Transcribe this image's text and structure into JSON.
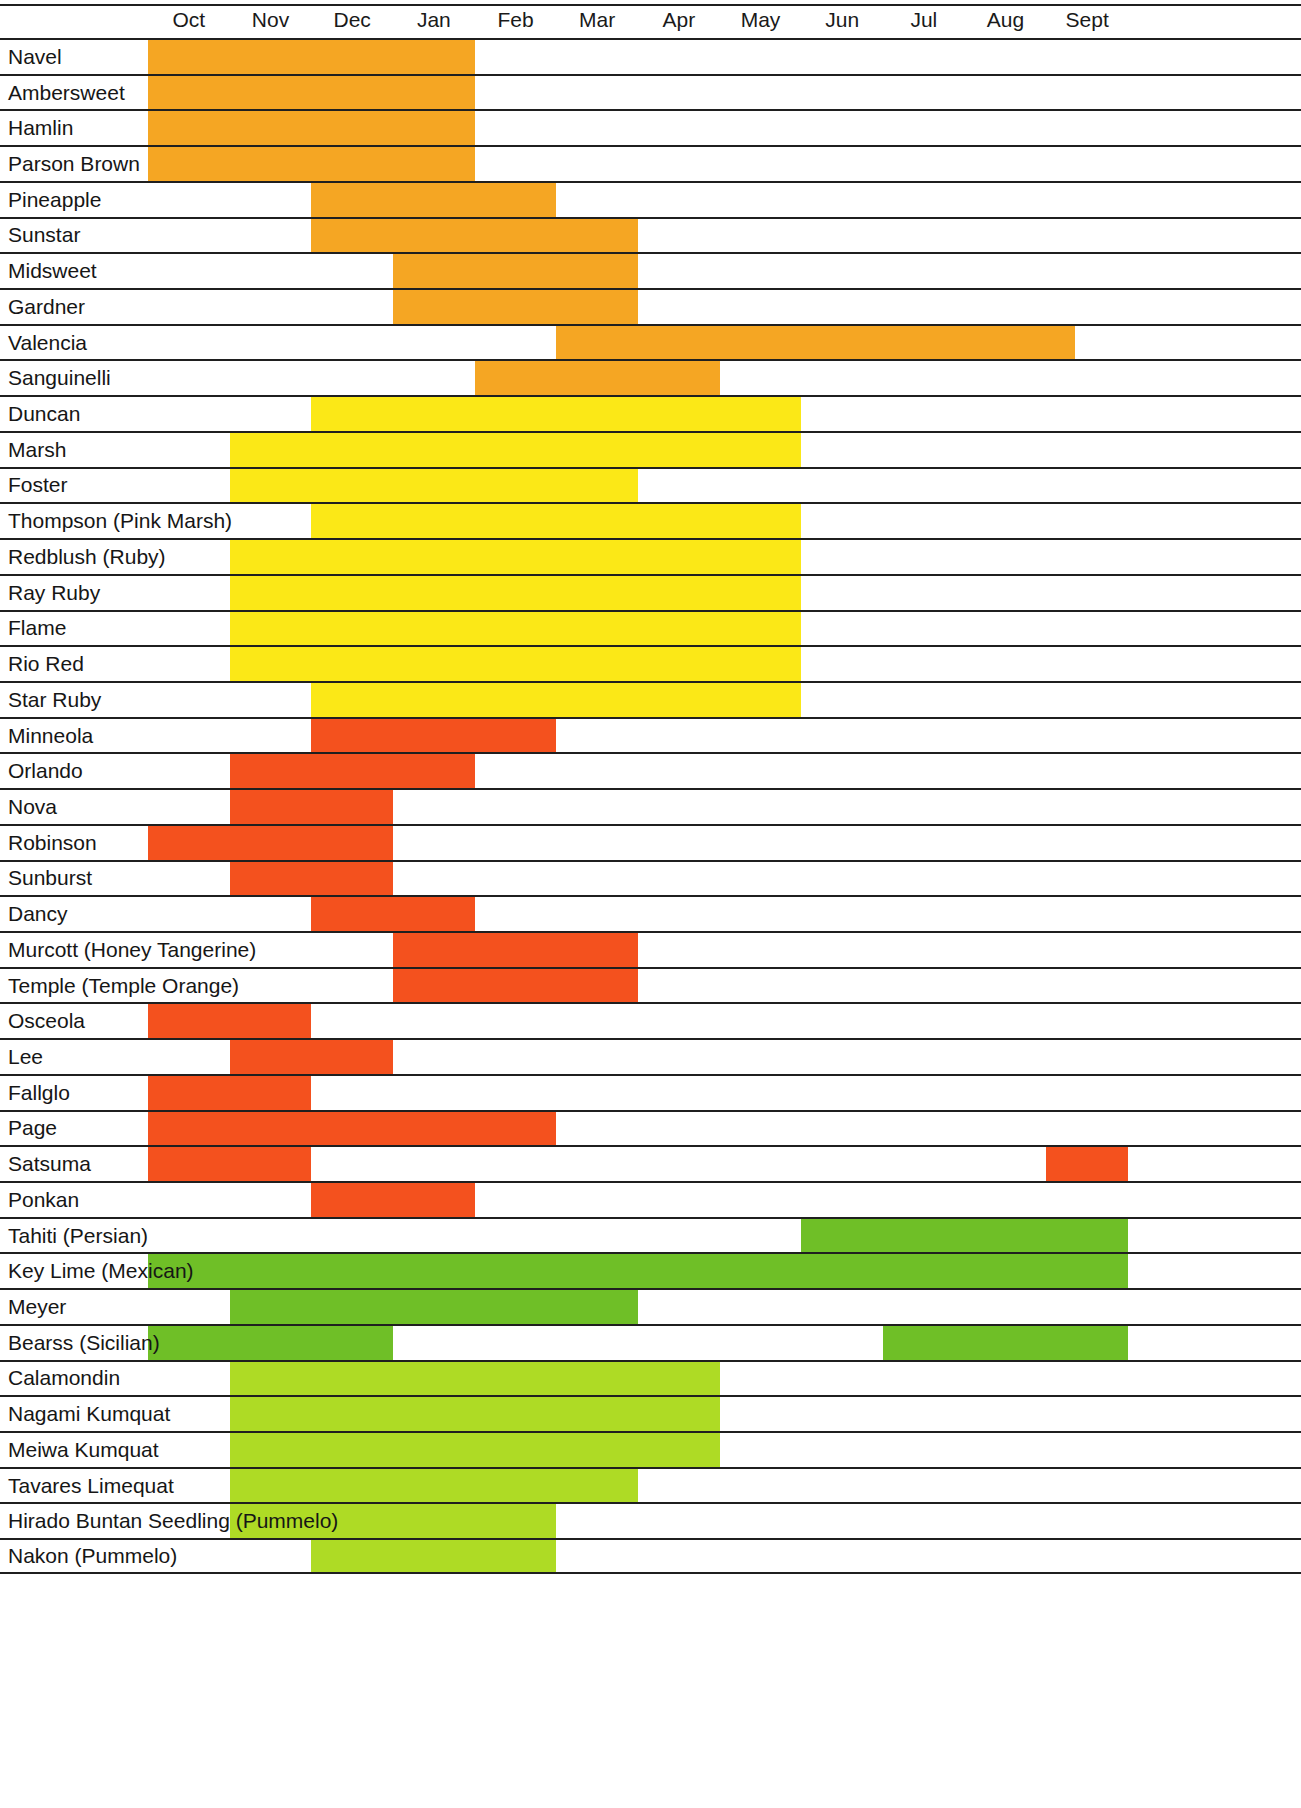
{
  "header": {
    "months": [
      "Oct",
      "Nov",
      "Dec",
      "Jan",
      "Feb",
      "Mar",
      "Apr",
      "May",
      "Jun",
      "Jul",
      "Aug",
      "Sept"
    ]
  },
  "colors": {
    "orange": "#F5A623",
    "yellow": "#FBE817",
    "red_orange": "#F4511E",
    "green": "#6FBF27",
    "yellow_green": "#AEDB25",
    "rule": "#1F1F1F",
    "text": "#161616",
    "background": "#FFFFFF"
  },
  "chart_data": {
    "type": "table",
    "xlabel": "",
    "ylabel": "",
    "grid": true,
    "legend_position": "none",
    "categories": [
      "Oct",
      "Nov",
      "Dec",
      "Jan",
      "Feb",
      "Mar",
      "Apr",
      "May",
      "Jun",
      "Jul",
      "Aug",
      "Sept"
    ],
    "x_axis_note": "Season runs October through September; 12 equal month columns",
    "groups": [
      {
        "name": "Oranges",
        "color": "#F5A623",
        "rows": [
          {
            "label": "Navel",
            "spans": [
              {
                "start_month": "Oct",
                "end_month": "Jan",
                "start_index": 0,
                "end_index": 4
              }
            ]
          },
          {
            "label": "Ambersweet",
            "spans": [
              {
                "start_month": "Oct",
                "end_month": "Jan",
                "start_index": 0,
                "end_index": 4
              }
            ]
          },
          {
            "label": "Hamlin",
            "spans": [
              {
                "start_month": "Oct",
                "end_month": "Jan",
                "start_index": 0,
                "end_index": 4
              }
            ]
          },
          {
            "label": "Parson Brown",
            "spans": [
              {
                "start_month": "Oct",
                "end_month": "Jan",
                "start_index": 0,
                "end_index": 4
              }
            ]
          },
          {
            "label": "Pineapple",
            "spans": [
              {
                "start_month": "Dec",
                "end_month": "Feb",
                "start_index": 2,
                "end_index": 5
              }
            ]
          },
          {
            "label": "Sunstar",
            "spans": [
              {
                "start_month": "Dec",
                "end_month": "Mar",
                "start_index": 2,
                "end_index": 6
              }
            ]
          },
          {
            "label": "Midsweet",
            "spans": [
              {
                "start_month": "Jan",
                "end_month": "Mar",
                "start_index": 3,
                "end_index": 6
              }
            ]
          },
          {
            "label": "Gardner",
            "spans": [
              {
                "start_month": "Jan",
                "end_month": "Mar",
                "start_index": 3,
                "end_index": 6
              }
            ]
          },
          {
            "label": "Valencia",
            "spans": [
              {
                "start_month": "Feb",
                "end_month": "Jun",
                "start_index": 5,
                "end_index": 11.35
              }
            ]
          },
          {
            "label": "Sanguinelli",
            "spans": [
              {
                "start_month": "Feb",
                "end_month": "Apr",
                "start_index": 4,
                "end_index": 7
              }
            ]
          }
        ]
      },
      {
        "name": "Grapefruit",
        "color": "#FBE817",
        "rows": [
          {
            "label": "Duncan",
            "spans": [
              {
                "start_month": "Dec",
                "end_month": "Jun",
                "start_index": 2,
                "end_index": 8
              }
            ]
          },
          {
            "label": "Marsh",
            "spans": [
              {
                "start_month": "Nov",
                "end_month": "Jun",
                "start_index": 1,
                "end_index": 8
              }
            ]
          },
          {
            "label": "Foster",
            "spans": [
              {
                "start_month": "Nov",
                "end_month": "Mar",
                "start_index": 1,
                "end_index": 6
              }
            ]
          },
          {
            "label": "Thompson (Pink Marsh)",
            "spans": [
              {
                "start_month": "Dec",
                "end_month": "Jun",
                "start_index": 2,
                "end_index": 8
              }
            ]
          },
          {
            "label": "Redblush (Ruby)",
            "spans": [
              {
                "start_month": "Nov",
                "end_month": "Jun",
                "start_index": 1,
                "end_index": 8
              }
            ]
          },
          {
            "label": "Ray Ruby",
            "spans": [
              {
                "start_month": "Nov",
                "end_month": "Jun",
                "start_index": 1,
                "end_index": 8
              }
            ]
          },
          {
            "label": "Flame",
            "spans": [
              {
                "start_month": "Nov",
                "end_month": "Jun",
                "start_index": 1,
                "end_index": 8
              }
            ]
          },
          {
            "label": "Rio Red",
            "spans": [
              {
                "start_month": "Nov",
                "end_month": "Jun",
                "start_index": 1,
                "end_index": 8
              }
            ]
          },
          {
            "label": "Star Ruby",
            "spans": [
              {
                "start_month": "Dec",
                "end_month": "Jun",
                "start_index": 2,
                "end_index": 8
              }
            ]
          }
        ]
      },
      {
        "name": "Mandarins / Tangerines",
        "color": "#F4511E",
        "rows": [
          {
            "label": "Minneola",
            "spans": [
              {
                "start_month": "Dec",
                "end_month": "Feb",
                "start_index": 2,
                "end_index": 5
              }
            ]
          },
          {
            "label": "Orlando",
            "spans": [
              {
                "start_month": "Nov",
                "end_month": "Jan",
                "start_index": 1,
                "end_index": 4
              }
            ]
          },
          {
            "label": "Nova",
            "spans": [
              {
                "start_month": "Nov",
                "end_month": "Dec",
                "start_index": 1,
                "end_index": 3
              }
            ]
          },
          {
            "label": "Robinson",
            "spans": [
              {
                "start_month": "Oct",
                "end_month": "Dec",
                "start_index": 0,
                "end_index": 3
              }
            ]
          },
          {
            "label": "Sunburst",
            "spans": [
              {
                "start_month": "Nov",
                "end_month": "Jan",
                "start_index": 1,
                "end_index": 3
              }
            ]
          },
          {
            "label": "Dancy",
            "spans": [
              {
                "start_month": "Dec",
                "end_month": "Jan",
                "start_index": 2,
                "end_index": 4
              }
            ]
          },
          {
            "label": "Murcott (Honey  Tangerine)",
            "spans": [
              {
                "start_month": "Jan",
                "end_month": "Mar",
                "start_index": 3,
                "end_index": 6
              }
            ]
          },
          {
            "label": "Temple (Temple Orange)",
            "spans": [
              {
                "start_month": "Jan",
                "end_month": "Mar",
                "start_index": 3,
                "end_index": 6
              }
            ]
          },
          {
            "label": "Osceola",
            "spans": [
              {
                "start_month": "Oct",
                "end_month": "Nov",
                "start_index": 0,
                "end_index": 2
              }
            ]
          },
          {
            "label": "Lee",
            "spans": [
              {
                "start_month": "Nov",
                "end_month": "Dec",
                "start_index": 1,
                "end_index": 3
              }
            ]
          },
          {
            "label": "Fallglo",
            "spans": [
              {
                "start_month": "Oct",
                "end_month": "Nov",
                "start_index": 0,
                "end_index": 2
              }
            ]
          },
          {
            "label": "Page",
            "spans": [
              {
                "start_month": "Oct",
                "end_month": "Feb",
                "start_index": 0,
                "end_index": 5
              }
            ]
          },
          {
            "label": "Satsuma",
            "spans": [
              {
                "start_month": "Oct",
                "end_month": "Nov",
                "start_index": 0,
                "end_index": 2
              },
              {
                "start_month": "Sept",
                "end_month": "Sept",
                "start_index": 11,
                "end_index": 12
              }
            ]
          },
          {
            "label": "Ponkan",
            "spans": [
              {
                "start_month": "Dec",
                "end_month": "Jan",
                "start_index": 2,
                "end_index": 4
              }
            ]
          }
        ]
      },
      {
        "name": "Limes / Lemons",
        "color": "#6FBF27",
        "rows": [
          {
            "label": "Tahiti (Persian)",
            "spans": [
              {
                "start_month": "Jun",
                "end_month": "Sept",
                "start_index": 8,
                "end_index": 12
              }
            ]
          },
          {
            "label": "Key Lime (Mexican)",
            "spans": [
              {
                "start_month": "Oct",
                "end_month": "Sept",
                "start_index": 0,
                "end_index": 12
              }
            ]
          },
          {
            "label": "Meyer",
            "spans": [
              {
                "start_month": "Nov",
                "end_month": "Mar",
                "start_index": 1,
                "end_index": 6
              }
            ]
          },
          {
            "label": "Bearss (Sicilian)",
            "spans": [
              {
                "start_month": "Oct",
                "end_month": "Dec",
                "start_index": 0,
                "end_index": 3
              },
              {
                "start_month": "Jul",
                "end_month": "Sept",
                "start_index": 9,
                "end_index": 12
              }
            ]
          }
        ]
      },
      {
        "name": "Kumquats / Limequats / Pummelos",
        "color": "#AEDB25",
        "rows": [
          {
            "label": "Calamondin",
            "spans": [
              {
                "start_month": "Nov",
                "end_month": "Apr",
                "start_index": 1,
                "end_index": 7
              }
            ]
          },
          {
            "label": "Nagami Kumquat",
            "spans": [
              {
                "start_month": "Nov",
                "end_month": "Apr",
                "start_index": 1,
                "end_index": 7
              }
            ]
          },
          {
            "label": "Meiwa Kumquat",
            "spans": [
              {
                "start_month": "Nov",
                "end_month": "Apr",
                "start_index": 1,
                "end_index": 7
              }
            ]
          },
          {
            "label": "Tavares Limequat",
            "spans": [
              {
                "start_month": "Nov",
                "end_month": "Mar",
                "start_index": 1,
                "end_index": 6
              }
            ]
          },
          {
            "label": "Hirado Buntan Seedling (Pummelo)",
            "spans": [
              {
                "start_month": "Nov",
                "end_month": "Feb",
                "start_index": 1,
                "end_index": 5
              }
            ]
          },
          {
            "label": "Nakon (Pummelo)",
            "spans": [
              {
                "start_month": "Dec",
                "end_month": "Feb",
                "start_index": 2,
                "end_index": 5
              }
            ]
          }
        ]
      }
    ]
  }
}
